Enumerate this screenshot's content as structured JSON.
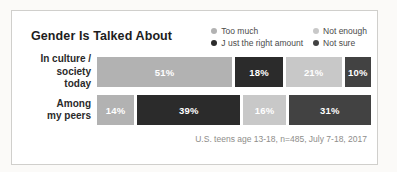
{
  "card": {
    "title": "Gender Is Talked About",
    "caption": "U.S. teens age 13-18, n=485, July 7-18, 2017"
  },
  "colors": {
    "too_much": "#b2b2b2",
    "not_enough": "#c8c8c8",
    "just_right": "#2b2b2b",
    "not_sure": "#424242",
    "segment_text": "#ffffff",
    "card_border": "#d0cfcc"
  },
  "legend": {
    "items": [
      {
        "label": "Too much",
        "color": "#b2b2b2"
      },
      {
        "label": "Not enough",
        "color": "#c8c8c8"
      },
      {
        "label": "J ust the right amount",
        "color": "#2b2b2b"
      },
      {
        "label": "Not sure",
        "color": "#424242"
      }
    ]
  },
  "rows": [
    {
      "label_line1": "In culture /",
      "label_line2": "society today",
      "segments": [
        {
          "label": "51%",
          "value": 51,
          "series": "Too much",
          "color": "#b2b2b2"
        },
        {
          "label": "18%",
          "value": 18,
          "series": "J ust the right amount",
          "color": "#2b2b2b"
        },
        {
          "label": "21%",
          "value": 21,
          "series": "Not enough",
          "color": "#c8c8c8"
        },
        {
          "label": "10%",
          "value": 10,
          "series": "Not sure",
          "color": "#424242"
        }
      ]
    },
    {
      "label_line1": "Among",
      "label_line2": "my peers",
      "segments": [
        {
          "label": "14%",
          "value": 14,
          "series": "Too much",
          "color": "#b2b2b2"
        },
        {
          "label": "39%",
          "value": 39,
          "series": "J ust the right amount",
          "color": "#2b2b2b"
        },
        {
          "label": "16%",
          "value": 16,
          "series": "Not enough",
          "color": "#c8c8c8"
        },
        {
          "label": "31%",
          "value": 31,
          "series": "Not sure",
          "color": "#424242"
        }
      ]
    }
  ],
  "chart_data": {
    "type": "bar",
    "orientation": "horizontal",
    "stacked": true,
    "title": "Gender Is Talked About",
    "categories": [
      "In culture / society today",
      "Among my peers"
    ],
    "series": [
      {
        "name": "Too much",
        "color": "#b2b2b2",
        "values": [
          51,
          14
        ]
      },
      {
        "name": "J ust the right amount",
        "color": "#2b2b2b",
        "values": [
          18,
          39
        ]
      },
      {
        "name": "Not enough",
        "color": "#c8c8c8",
        "values": [
          21,
          16
        ]
      },
      {
        "name": "Not sure",
        "color": "#424242",
        "values": [
          10,
          31
        ]
      }
    ],
    "value_unit": "percent",
    "xlim": [
      0,
      100
    ],
    "grid": false,
    "legend_position": "top-right",
    "source_note": "U.S. teens age 13-18, n=485, July 7-18, 2017"
  }
}
